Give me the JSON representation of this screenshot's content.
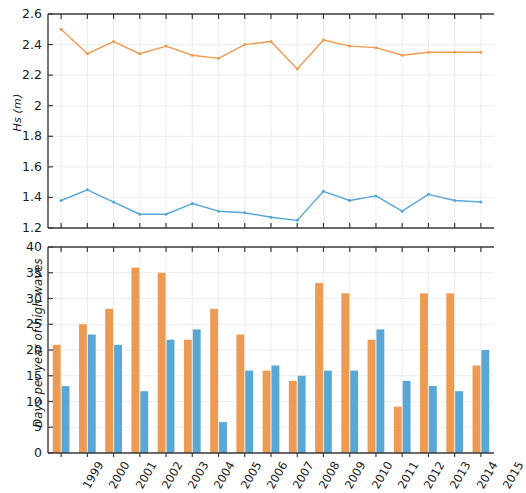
{
  "figure": {
    "background": "#ffffff",
    "colors": {
      "series_orange": "#ED9B52",
      "series_blue": "#58A7D4",
      "axis": "#3a3a3a",
      "grid": "#e8e8e8",
      "text": "#1a1a1a"
    }
  },
  "chart_data": [
    {
      "type": "line",
      "title": "",
      "xlabel": "",
      "ylabel": "Hs (m)",
      "ylim": [
        1.2,
        2.6
      ],
      "yticks": [
        1.2,
        1.4,
        1.6,
        1.8,
        2,
        2.2,
        2.4,
        2.6
      ],
      "ytick_labels": [
        "1.2",
        "1.4",
        "1.6",
        "1.8",
        "2",
        "2.2",
        "2.4",
        "2.6"
      ],
      "x": [
        1999,
        2000,
        2001,
        2002,
        2003,
        2004,
        2005,
        2006,
        2007,
        2008,
        2009,
        2010,
        2011,
        2012,
        2013,
        2014,
        2015
      ],
      "xlim": [
        1998.5,
        2015.5
      ],
      "grid": true,
      "legend": "none",
      "series": [
        {
          "name": "upper",
          "color": "#ED9B52",
          "marker": "dot",
          "values": [
            2.5,
            2.34,
            2.42,
            2.34,
            2.39,
            2.33,
            2.31,
            2.4,
            2.42,
            2.24,
            2.43,
            2.39,
            2.38,
            2.33,
            2.35,
            2.35,
            2.35
          ]
        },
        {
          "name": "lower",
          "color": "#58A7D4",
          "marker": "dot",
          "values": [
            1.38,
            1.45,
            1.37,
            1.29,
            1.29,
            1.36,
            1.31,
            1.3,
            1.27,
            1.25,
            1.44,
            1.38,
            1.41,
            1.31,
            1.42,
            1.38,
            1.37
          ]
        }
      ]
    },
    {
      "type": "bar",
      "title": "",
      "xlabel": "",
      "ylabel": "Days per year of high waves",
      "ylim": [
        0,
        40
      ],
      "yticks": [
        0,
        5,
        10,
        15,
        20,
        25,
        30,
        35,
        40
      ],
      "ytick_labels": [
        "0",
        "5",
        "10",
        "15",
        "20",
        "25",
        "30",
        "35",
        "40"
      ],
      "categories": [
        "1999",
        "2000",
        "2001",
        "2002",
        "2003",
        "2004",
        "2005",
        "2006",
        "2007",
        "2008",
        "2009",
        "2010",
        "2011",
        "2012",
        "2013",
        "2014",
        "2015"
      ],
      "grid": true,
      "legend": "none",
      "series": [
        {
          "name": "orange",
          "color": "#ED9B52",
          "values": [
            21,
            25,
            28,
            36,
            35,
            22,
            28,
            23,
            16,
            14,
            33,
            31,
            22,
            9,
            31,
            31,
            17
          ]
        },
        {
          "name": "blue",
          "color": "#58A7D4",
          "values": [
            13,
            23,
            21,
            12,
            22,
            24,
            6,
            16,
            17,
            15,
            16,
            16,
            24,
            14,
            13,
            12,
            20
          ]
        }
      ]
    }
  ]
}
